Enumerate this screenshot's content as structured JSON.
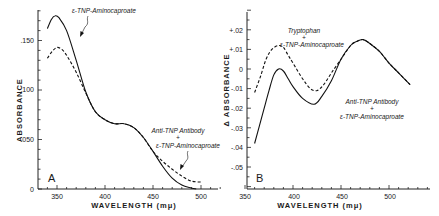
{
  "chart_data": [
    {
      "panel": "A",
      "type": "line",
      "title": "",
      "xlabel": "WAVELENGTH (mμ)",
      "ylabel": "ABSORBANCE",
      "xlim": [
        340,
        520
      ],
      "ylim": [
        0,
        0.18
      ],
      "xticks": [
        350,
        400,
        450,
        500
      ],
      "xtick_labels": [
        "350",
        "400",
        "450",
        "500"
      ],
      "yticks": [
        0,
        0.05,
        0.1,
        0.15
      ],
      "ytick_labels": [
        "0",
        ".050",
        ".100",
        ".150"
      ],
      "grid": false,
      "series": [
        {
          "name": "ε-TNP-Aminocaproate",
          "style": "solid",
          "x": [
            340,
            344,
            348,
            352,
            360,
            370,
            380,
            390,
            400,
            410,
            420,
            430,
            440,
            450,
            460,
            470,
            480,
            490,
            495
          ],
          "y": [
            0.162,
            0.171,
            0.175,
            0.173,
            0.16,
            0.13,
            0.098,
            0.078,
            0.07,
            0.066,
            0.066,
            0.062,
            0.052,
            0.038,
            0.023,
            0.011,
            0.004,
            0.001,
            0.0
          ]
        },
        {
          "name": "Anti-TNP Antibody + ε-TNP-Aminocaproate",
          "style": "dashed",
          "x": [
            340,
            345,
            350,
            355,
            360,
            370,
            380,
            390,
            400,
            410,
            420,
            430,
            440,
            450,
            460,
            470,
            480,
            490,
            500
          ],
          "y": [
            0.132,
            0.139,
            0.143,
            0.141,
            0.135,
            0.118,
            0.097,
            0.078,
            0.07,
            0.066,
            0.066,
            0.062,
            0.052,
            0.038,
            0.028,
            0.02,
            0.013,
            0.008,
            0.007
          ]
        }
      ],
      "annotations": [
        "ε-TNP-Aminocaproate",
        "Anti-TNP Antibody",
        "+",
        "ε-TNP-Aminocaproate",
        "A"
      ]
    },
    {
      "panel": "B",
      "type": "line",
      "title": "",
      "xlabel": "WAVELENGTH (mμ)",
      "ylabel": "Δ ABSORBANCE",
      "xlim": [
        350,
        540
      ],
      "ylim": [
        -0.061,
        0.03
      ],
      "xticks": [
        350,
        400,
        450,
        500
      ],
      "xtick_labels": [
        "350",
        "400",
        "450",
        "500"
      ],
      "yticks": [
        0.02,
        0.01,
        0,
        -0.01,
        -0.02,
        -0.03,
        -0.04,
        -0.05
      ],
      "ytick_labels": [
        "+.02",
        "+.01",
        "0",
        "-.01",
        "-.02",
        "-.03",
        "-.04",
        "-.05"
      ],
      "grid": false,
      "series": [
        {
          "name": "Anti-TNP Antibody + ε-TNP-Aminocaproate",
          "style": "solid",
          "x": [
            360,
            365,
            370,
            375,
            380,
            385,
            390,
            395,
            400,
            410,
            422,
            430,
            440,
            450,
            460,
            466,
            473,
            480,
            490,
            500,
            510,
            522
          ],
          "y": [
            -0.038,
            -0.029,
            -0.02,
            -0.011,
            -0.003,
            0.0,
            -0.001,
            -0.005,
            -0.009,
            -0.015,
            -0.018,
            -0.014,
            -0.006,
            0.005,
            0.012,
            0.014,
            0.015,
            0.013,
            0.009,
            0.003,
            -0.002,
            -0.008
          ]
        },
        {
          "name": "Tryptophan + ε-TNP-Aminocaproate",
          "style": "dashed",
          "x": [
            360,
            366,
            372,
            378,
            385,
            390,
            395,
            400,
            410,
            418,
            425,
            432,
            440,
            450,
            460,
            466,
            473,
            480,
            490,
            500,
            510,
            522
          ],
          "y": [
            -0.012,
            -0.004,
            0.005,
            0.01,
            0.012,
            0.011,
            0.007,
            0.003,
            -0.005,
            -0.01,
            -0.011,
            -0.008,
            -0.002,
            0.005,
            0.012,
            0.014,
            0.015,
            0.013,
            0.009,
            0.003,
            -0.002,
            -0.008
          ]
        }
      ],
      "annotations": [
        "Tryptophan",
        "+",
        "ε-TNP-Aminocaproate",
        "Anti-TNP Antibody",
        "+",
        "ε-TNP-Aminocaproate",
        "B"
      ]
    }
  ],
  "panelA": {
    "letter": "A",
    "ylabel": "ABSORBANCE",
    "xlabel": "WAVELENGTH (mμ)",
    "ytick_labels": [
      "0",
      ".050",
      ".100",
      ".150"
    ],
    "xtick_labels": [
      "350",
      "400",
      "450",
      "500"
    ],
    "label_solid": "ε-TNP-Aminocaproate",
    "label_dashed_1": "Anti-TNP Antibody",
    "label_dashed_plus": "+",
    "label_dashed_2": "ε-TNP-Aminocaproate"
  },
  "panelB": {
    "letter": "B",
    "ylabel": "Δ ABSORBANCE",
    "xlabel": "WAVELENGTH (mμ)",
    "ytick_labels": [
      "+.02",
      "+.01",
      "0",
      "-.01",
      "-.02",
      "-.03",
      "-.04",
      "-.05"
    ],
    "xtick_labels": [
      "350",
      "400",
      "450",
      "500"
    ],
    "label_dashed_1": "Tryptophan",
    "label_dashed_plus": "+",
    "label_dashed_2": "ε-TNP-Aminocaproate",
    "label_solid_1": "Anti-TNP Antibody",
    "label_solid_plus": "+",
    "label_solid_2": "ε-TNP-Aminocaproate"
  }
}
